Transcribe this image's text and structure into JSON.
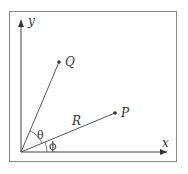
{
  "diagram": {
    "axes": {
      "x_label": "x",
      "y_label": "y"
    },
    "points": [
      {
        "name": "Q",
        "label": "Q"
      },
      {
        "name": "P",
        "label": "P"
      }
    ],
    "segment_label": "R",
    "angles": {
      "theta": "θ",
      "phi": "ϕ"
    },
    "colors": {
      "line": "#444444",
      "frame": "#888888",
      "background": "#ffffff"
    }
  }
}
